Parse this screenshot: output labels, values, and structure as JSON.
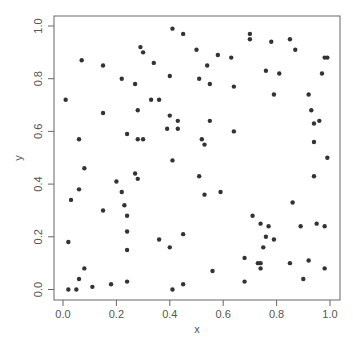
{
  "chart_data": {
    "type": "scatter",
    "title": "",
    "xlabel": "x",
    "ylabel": "y",
    "xlim": [
      0,
      1
    ],
    "ylim": [
      0,
      1
    ],
    "grid": false,
    "xticks": [
      "0.0",
      "0.2",
      "0.4",
      "0.6",
      "0.8",
      "1.0"
    ],
    "yticks": [
      "0.0",
      "0.2",
      "0.4",
      "0.6",
      "0.8",
      "1.0"
    ],
    "point_color": "#333333",
    "points": [
      [
        0.01,
        0.72
      ],
      [
        0.07,
        0.87
      ],
      [
        0.06,
        0.57
      ],
      [
        0.15,
        0.85
      ],
      [
        0.15,
        0.67
      ],
      [
        0.22,
        0.8
      ],
      [
        0.27,
        0.78
      ],
      [
        0.29,
        0.92
      ],
      [
        0.3,
        0.9
      ],
      [
        0.24,
        0.59
      ],
      [
        0.28,
        0.57
      ],
      [
        0.28,
        0.68
      ],
      [
        0.41,
        0.99
      ],
      [
        0.45,
        0.97
      ],
      [
        0.34,
        0.86
      ],
      [
        0.4,
        0.81
      ],
      [
        0.5,
        0.91
      ],
      [
        0.51,
        0.8
      ],
      [
        0.54,
        0.85
      ],
      [
        0.55,
        0.78
      ],
      [
        0.58,
        0.89
      ],
      [
        0.63,
        0.88
      ],
      [
        0.64,
        0.77
      ],
      [
        0.33,
        0.72
      ],
      [
        0.36,
        0.72
      ],
      [
        0.4,
        0.66
      ],
      [
        0.43,
        0.64
      ],
      [
        0.55,
        0.64
      ],
      [
        0.39,
        0.61
      ],
      [
        0.43,
        0.61
      ],
      [
        0.64,
        0.6
      ],
      [
        0.3,
        0.57
      ],
      [
        0.52,
        0.57
      ],
      [
        0.53,
        0.55
      ],
      [
        0.7,
        0.97
      ],
      [
        0.7,
        0.95
      ],
      [
        0.78,
        0.94
      ],
      [
        0.85,
        0.95
      ],
      [
        0.87,
        0.91
      ],
      [
        0.76,
        0.83
      ],
      [
        0.81,
        0.82
      ],
      [
        0.98,
        0.88
      ],
      [
        0.99,
        0.88
      ],
      [
        0.97,
        0.82
      ],
      [
        0.79,
        0.74
      ],
      [
        0.92,
        0.74
      ],
      [
        0.93,
        0.68
      ],
      [
        0.94,
        0.63
      ],
      [
        0.96,
        0.64
      ],
      [
        0.94,
        0.56
      ],
      [
        0.02,
        0.0
      ],
      [
        0.05,
        0.0
      ],
      [
        0.02,
        0.18
      ],
      [
        0.03,
        0.34
      ],
      [
        0.06,
        0.38
      ],
      [
        0.08,
        0.46
      ],
      [
        0.06,
        0.04
      ],
      [
        0.08,
        0.08
      ],
      [
        0.11,
        0.01
      ],
      [
        0.15,
        0.3
      ],
      [
        0.18,
        0.02
      ],
      [
        0.2,
        0.41
      ],
      [
        0.22,
        0.37
      ],
      [
        0.23,
        0.32
      ],
      [
        0.24,
        0.28
      ],
      [
        0.24,
        0.22
      ],
      [
        0.24,
        0.15
      ],
      [
        0.24,
        0.03
      ],
      [
        0.27,
        0.44
      ],
      [
        0.28,
        0.42
      ],
      [
        0.41,
        0.49
      ],
      [
        0.51,
        0.43
      ],
      [
        0.53,
        0.36
      ],
      [
        0.59,
        0.37
      ],
      [
        0.36,
        0.19
      ],
      [
        0.45,
        0.21
      ],
      [
        0.4,
        0.16
      ],
      [
        0.56,
        0.07
      ],
      [
        0.45,
        0.02
      ],
      [
        0.41,
        0.0
      ],
      [
        0.99,
        0.5
      ],
      [
        0.94,
        0.43
      ],
      [
        0.86,
        0.33
      ],
      [
        0.71,
        0.28
      ],
      [
        0.74,
        0.25
      ],
      [
        0.77,
        0.24
      ],
      [
        0.89,
        0.24
      ],
      [
        0.95,
        0.25
      ],
      [
        0.98,
        0.24
      ],
      [
        0.76,
        0.2
      ],
      [
        0.79,
        0.19
      ],
      [
        0.75,
        0.16
      ],
      [
        0.68,
        0.12
      ],
      [
        0.73,
        0.1
      ],
      [
        0.74,
        0.1
      ],
      [
        0.74,
        0.08
      ],
      [
        0.85,
        0.1
      ],
      [
        0.92,
        0.11
      ],
      [
        0.98,
        0.08
      ],
      [
        0.68,
        0.03
      ],
      [
        0.9,
        0.04
      ]
    ]
  }
}
